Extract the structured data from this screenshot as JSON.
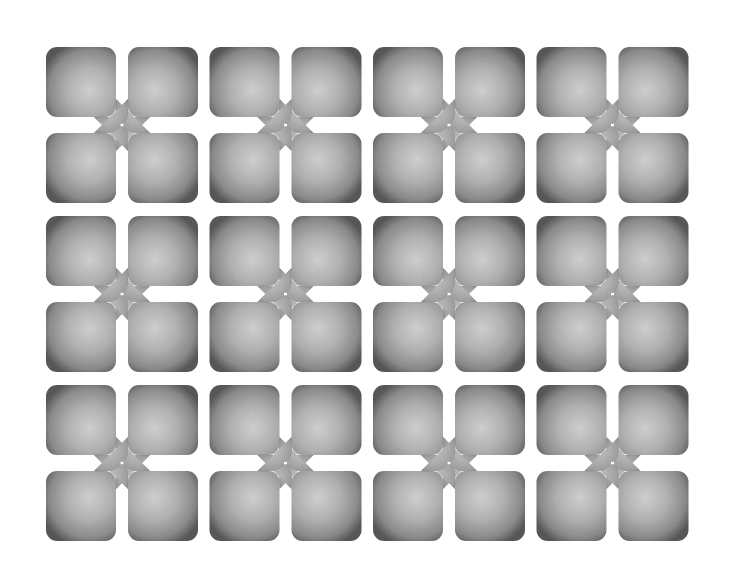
{
  "pattern": {
    "description": "Repeating grid of quatrefoil tile groups: four rounded gradient squares whose inner corners taper into petals meeting at a central point",
    "columns": 4,
    "rows": 3,
    "origin": {
      "x": 122,
      "y": 125
    },
    "spacing": {
      "x": 163.5,
      "y": 169
    },
    "square_size": 70,
    "square_gap": 16,
    "corner_radius": 11,
    "colors": {
      "background": "#ffffff",
      "edge": "#595959",
      "mid": "#8c8c8c",
      "highlight": "#d2d2d2",
      "petal": "#b4b4b4"
    }
  },
  "groups": [
    {
      "row": 0,
      "col": 0
    },
    {
      "row": 0,
      "col": 1
    },
    {
      "row": 0,
      "col": 2
    },
    {
      "row": 0,
      "col": 3
    },
    {
      "row": 1,
      "col": 0
    },
    {
      "row": 1,
      "col": 1
    },
    {
      "row": 1,
      "col": 2
    },
    {
      "row": 1,
      "col": 3
    },
    {
      "row": 2,
      "col": 0
    },
    {
      "row": 2,
      "col": 1
    },
    {
      "row": 2,
      "col": 2
    },
    {
      "row": 2,
      "col": 3
    }
  ]
}
